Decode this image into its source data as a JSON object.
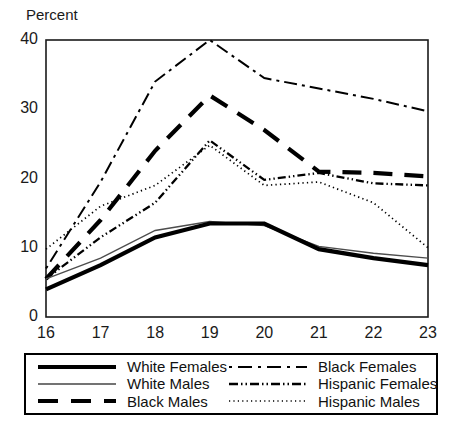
{
  "chart_data": {
    "type": "line",
    "title": "",
    "ylabel": "Percent",
    "xlabel": "",
    "x": [
      16,
      17,
      18,
      19,
      20,
      21,
      22,
      23
    ],
    "xtick_labels": [
      "16",
      "17",
      "18",
      "19",
      "20",
      "21",
      "22",
      "23"
    ],
    "ytick_labels": [
      "0",
      "10",
      "20",
      "30",
      "40"
    ],
    "yticks": [
      0,
      10,
      20,
      30,
      40
    ],
    "xlim": [
      16,
      23
    ],
    "ylim": [
      0,
      40
    ],
    "grid": false,
    "legend_position": "below-axes",
    "series": [
      {
        "name": "White Females",
        "style": "solid-thick",
        "color": "#000000",
        "values": [
          4.0,
          7.5,
          11.5,
          13.5,
          13.5,
          9.8,
          8.5,
          7.5
        ]
      },
      {
        "name": "White Males",
        "style": "solid-thin",
        "color": "#4d4d4d",
        "values": [
          5.5,
          8.5,
          12.5,
          13.8,
          13.2,
          10.2,
          9.2,
          8.5
        ]
      },
      {
        "name": "Black Males",
        "style": "dashed-thick",
        "color": "#000000",
        "values": [
          5.5,
          14.0,
          24.0,
          32.0,
          27.0,
          21.0,
          20.8,
          20.3
        ]
      },
      {
        "name": "Black Females",
        "style": "dashed-thin",
        "color": "#000000",
        "values": [
          7.0,
          19.5,
          34.0,
          40.0,
          34.5,
          33.0,
          31.5,
          29.7
        ]
      },
      {
        "name": "Hispanic Females",
        "style": "dash-dot-thin",
        "color": "#000000",
        "values": [
          5.5,
          11.5,
          16.5,
          25.5,
          19.8,
          20.8,
          19.3,
          19.0
        ]
      },
      {
        "name": "Hispanic Males",
        "style": "dotted-thin",
        "color": "#000000",
        "values": [
          9.8,
          16.0,
          19.0,
          24.8,
          19.0,
          19.5,
          16.5,
          10.0
        ]
      }
    ]
  },
  "axes": {
    "ylabel": "Percent",
    "frame_color": "#000000"
  },
  "legend": {
    "entries": [
      {
        "label": "White Females",
        "swatch": "legend-swatch-solid-thick"
      },
      {
        "label": "Black Females",
        "swatch": "legend-swatch-dashed-thin"
      },
      {
        "label": "White Males",
        "swatch": "legend-swatch-solid-thin"
      },
      {
        "label": "Hispanic Females",
        "swatch": "legend-swatch-dash-dot"
      },
      {
        "label": "Black Males",
        "swatch": "legend-swatch-dashed-thick"
      },
      {
        "label": "Hispanic Males",
        "swatch": "legend-swatch-dotted"
      }
    ]
  },
  "title_strip": {
    "text": ""
  }
}
